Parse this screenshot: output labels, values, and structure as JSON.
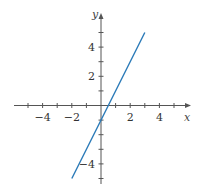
{
  "chart_data": {
    "type": "line",
    "title": "",
    "xlabel": "x",
    "ylabel": "y",
    "xlim": [
      -5.5,
      5.5
    ],
    "ylim": [
      -5.5,
      6
    ],
    "x_ticks": [
      -5,
      -4,
      -3,
      -2,
      -1,
      1,
      2,
      3,
      4,
      5
    ],
    "x_tick_labels": [
      "-4",
      "-2",
      "2",
      "4"
    ],
    "x_tick_label_values": [
      -4,
      -2,
      2,
      4
    ],
    "y_ticks": [
      -5,
      -4,
      -3,
      -2,
      -1,
      1,
      2,
      3,
      4,
      5
    ],
    "y_tick_labels": [
      "4",
      "2",
      "-4"
    ],
    "y_tick_label_values": [
      4,
      2,
      -4
    ],
    "grid": false,
    "series": [
      {
        "name": "y = 2x - 1",
        "x": [
          -2,
          3
        ],
        "y": [
          -5,
          5
        ],
        "color": "#2a7ab8"
      }
    ]
  }
}
